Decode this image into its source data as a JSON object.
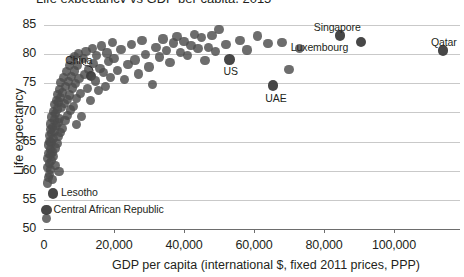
{
  "chart": {
    "title_partial": "Life expectancy vs GDP per capita, 2015",
    "ylabel": "Life expectancy",
    "xlabel": "GDP per capita (international $, fixed 2011 prices, PPP)"
  },
  "chart_data": {
    "type": "scatter",
    "title": "Life expectancy vs GDP per capita, 2015",
    "xlabel": "GDP per capita (international $, fixed 2011 prices, PPP)",
    "ylabel": "Life expectancy",
    "xlim": [
      0,
      118000
    ],
    "ylim": [
      50,
      86
    ],
    "xticks": [
      0,
      20000,
      40000,
      60000,
      80000,
      100000
    ],
    "xticklabels": [
      "0",
      "20,000",
      "40,000",
      "60,000",
      "80,000",
      "100,000"
    ],
    "yticks": [
      50,
      55,
      60,
      65,
      70,
      75,
      80,
      85
    ],
    "yticklabels": [
      "50",
      "55",
      "60",
      "65",
      "70",
      "75",
      "80",
      "85"
    ],
    "grid": true,
    "legend": "none",
    "marker_color": "#4d4d4d",
    "marker_opacity": 0.82,
    "annotations": [
      {
        "label": "China",
        "x": 13500,
        "y": 76.2,
        "leader": true
      },
      {
        "label": "Singapore",
        "x": 84500,
        "y": 83.2,
        "leader": false
      },
      {
        "label": "Luxembourg",
        "x": 90500,
        "y": 82.1,
        "leader": false
      },
      {
        "label": "Qatar",
        "x": 114000,
        "y": 80.6,
        "leader": false
      },
      {
        "label": "US",
        "x": 53000,
        "y": 79.1,
        "leader": false
      },
      {
        "label": "UAE",
        "x": 65500,
        "y": 74.6,
        "leader": false
      },
      {
        "label": "Lesotho",
        "x": 2600,
        "y": 56.1,
        "leader": false
      },
      {
        "label": "Central African Republic",
        "x": 700,
        "y": 53.3,
        "leader": false
      }
    ],
    "points": [
      [
        600,
        51.8
      ],
      [
        700,
        53.3
      ],
      [
        900,
        57.9
      ],
      [
        1000,
        60.5
      ],
      [
        1100,
        62.1
      ],
      [
        1200,
        63.0
      ],
      [
        1300,
        58.8
      ],
      [
        1400,
        64.4
      ],
      [
        1500,
        61.3
      ],
      [
        1550,
        66.0
      ],
      [
        1600,
        59.4
      ],
      [
        1700,
        65.0
      ],
      [
        1750,
        62.8
      ],
      [
        1800,
        67.1
      ],
      [
        1850,
        60.2
      ],
      [
        1900,
        63.6
      ],
      [
        1950,
        68.0
      ],
      [
        2000,
        64.9
      ],
      [
        2100,
        61.7
      ],
      [
        2200,
        66.4
      ],
      [
        2300,
        69.2
      ],
      [
        2350,
        63.2
      ],
      [
        2400,
        58.5
      ],
      [
        2500,
        67.4
      ],
      [
        2600,
        56.1
      ],
      [
        2700,
        70.1
      ],
      [
        2750,
        65.5
      ],
      [
        2800,
        62.4
      ],
      [
        2900,
        68.7
      ],
      [
        3000,
        71.3
      ],
      [
        3100,
        66.8
      ],
      [
        3200,
        63.9
      ],
      [
        3300,
        69.8
      ],
      [
        3400,
        60.9
      ],
      [
        3500,
        72.0
      ],
      [
        3600,
        67.7
      ],
      [
        3700,
        64.7
      ],
      [
        3800,
        70.6
      ],
      [
        3900,
        73.1
      ],
      [
        4000,
        68.3
      ],
      [
        4100,
        65.9
      ],
      [
        4200,
        71.8
      ],
      [
        4300,
        59.8
      ],
      [
        4400,
        74.0
      ],
      [
        4500,
        69.0
      ],
      [
        4600,
        66.5
      ],
      [
        4700,
        72.6
      ],
      [
        4800,
        75.1
      ],
      [
        5000,
        70.9
      ],
      [
        5200,
        67.2
      ],
      [
        5400,
        73.4
      ],
      [
        5600,
        76.0
      ],
      [
        5800,
        71.5
      ],
      [
        6000,
        68.6
      ],
      [
        6200,
        74.5
      ],
      [
        6400,
        77.0
      ],
      [
        6600,
        72.2
      ],
      [
        6800,
        69.5
      ],
      [
        7000,
        75.3
      ],
      [
        7200,
        78.1
      ],
      [
        7400,
        73.0
      ],
      [
        7600,
        70.4
      ],
      [
        7800,
        76.2
      ],
      [
        8000,
        79.0
      ],
      [
        8200,
        74.2
      ],
      [
        8400,
        71.0
      ],
      [
        8600,
        77.1
      ],
      [
        8800,
        79.6
      ],
      [
        9000,
        75.0
      ],
      [
        9200,
        72.4
      ],
      [
        9400,
        67.9
      ],
      [
        9600,
        78.0
      ],
      [
        9800,
        80.1
      ],
      [
        10000,
        75.8
      ],
      [
        10400,
        73.2
      ],
      [
        10800,
        69.3
      ],
      [
        11200,
        79.2
      ],
      [
        11600,
        76.5
      ],
      [
        12000,
        80.4
      ],
      [
        12400,
        74.1
      ],
      [
        12800,
        77.4
      ],
      [
        13200,
        72.1
      ],
      [
        13500,
        76.2
      ],
      [
        13800,
        81.0
      ],
      [
        14200,
        78.4
      ],
      [
        14600,
        75.4
      ],
      [
        15000,
        79.8
      ],
      [
        15500,
        73.8
      ],
      [
        16000,
        77.6
      ],
      [
        16500,
        81.4
      ],
      [
        17000,
        76.8
      ],
      [
        17500,
        74.4
      ],
      [
        18000,
        80.2
      ],
      [
        18500,
        78.7
      ],
      [
        19000,
        76.0
      ],
      [
        19500,
        82.0
      ],
      [
        20000,
        79.3
      ],
      [
        21000,
        77.2
      ],
      [
        22000,
        80.8
      ],
      [
        23000,
        75.6
      ],
      [
        24000,
        78.2
      ],
      [
        25000,
        81.6
      ],
      [
        26000,
        79.0
      ],
      [
        27000,
        76.6
      ],
      [
        28000,
        82.3
      ],
      [
        29000,
        80.0
      ],
      [
        30000,
        77.8
      ],
      [
        31000,
        74.8
      ],
      [
        32000,
        81.2
      ],
      [
        33000,
        79.5
      ],
      [
        34000,
        82.6
      ],
      [
        35000,
        80.6
      ],
      [
        36000,
        78.5
      ],
      [
        37000,
        81.9
      ],
      [
        38000,
        83.0
      ],
      [
        39000,
        80.3
      ],
      [
        40000,
        82.1
      ],
      [
        41000,
        79.7
      ],
      [
        42000,
        81.5
      ],
      [
        43000,
        83.4
      ],
      [
        44000,
        80.9
      ],
      [
        45000,
        82.8
      ],
      [
        46000,
        78.9
      ],
      [
        47000,
        81.1
      ],
      [
        48000,
        83.2
      ],
      [
        49000,
        80.5
      ],
      [
        50000,
        84.2
      ],
      [
        52000,
        81.7
      ],
      [
        53000,
        79.1
      ],
      [
        56000,
        82.4
      ],
      [
        58000,
        80.7
      ],
      [
        61000,
        83.1
      ],
      [
        64000,
        81.8
      ],
      [
        65500,
        74.6
      ],
      [
        68000,
        82.0
      ],
      [
        70000,
        77.3
      ],
      [
        73000,
        80.9
      ],
      [
        84500,
        83.2
      ],
      [
        90500,
        82.1
      ],
      [
        114000,
        80.6
      ]
    ]
  }
}
